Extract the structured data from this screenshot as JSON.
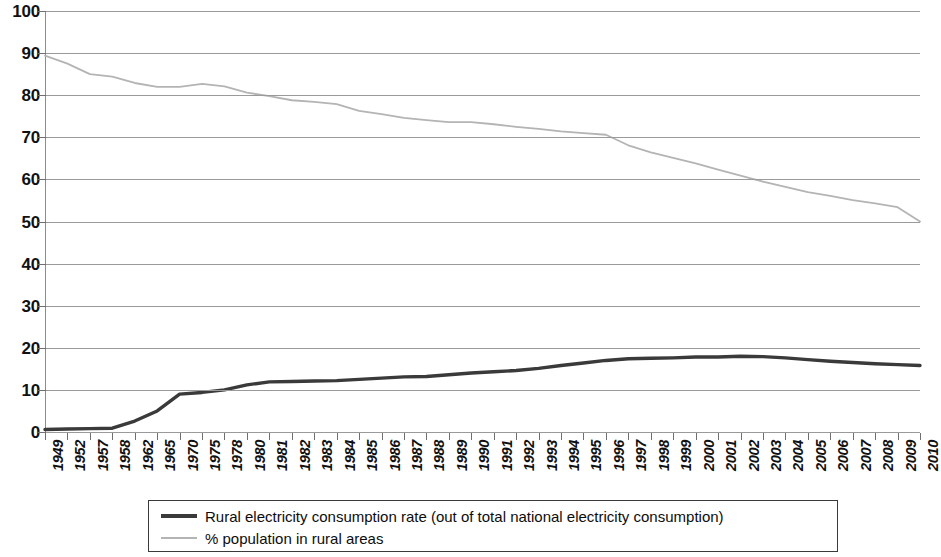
{
  "chart_data": {
    "type": "line",
    "title": "",
    "xlabel": "",
    "ylabel": "",
    "ylim": [
      0,
      100
    ],
    "y_ticks": [
      0,
      10,
      20,
      30,
      40,
      50,
      60,
      70,
      80,
      90,
      100
    ],
    "y_tick_labels": [
      "0",
      "10",
      "20",
      "30",
      "40",
      "50",
      "60",
      "70",
      "80",
      "90",
      "100"
    ],
    "grid": true,
    "legend_position": "bottom",
    "categories": [
      "1949",
      "1952",
      "1957",
      "1958",
      "1962",
      "1965",
      "1970",
      "1975",
      "1978",
      "1980",
      "1981",
      "1982",
      "1983",
      "1984",
      "1985",
      "1986",
      "1987",
      "1988",
      "1989",
      "1990",
      "1991",
      "1992",
      "1993",
      "1994",
      "1995",
      "1996",
      "1997",
      "1998",
      "1999",
      "2000",
      "2001",
      "2002",
      "2003",
      "2004",
      "2005",
      "2006",
      "2007",
      "2008",
      "2009",
      "2010"
    ],
    "series": [
      {
        "name": "Rural electricity consumption rate (out of total national electricity consumption)",
        "color": "#3a3a3a",
        "width": 3.4,
        "values": [
          0.6,
          0.7,
          0.8,
          0.9,
          2.6,
          5.0,
          9.0,
          9.4,
          10.0,
          11.2,
          11.9,
          12.0,
          12.1,
          12.2,
          12.5,
          12.8,
          13.1,
          13.2,
          13.6,
          14.0,
          14.3,
          14.6,
          15.1,
          15.8,
          16.4,
          17.0,
          17.4,
          17.5,
          17.6,
          17.8,
          17.8,
          18.0,
          17.9,
          17.6,
          17.2,
          16.8,
          16.5,
          16.2,
          16.0,
          15.8
        ]
      },
      {
        "name": "% population in rural areas",
        "color": "#b4b4b4",
        "width": 1.8,
        "values": [
          89.4,
          87.5,
          85.0,
          84.4,
          82.9,
          82.0,
          82.0,
          82.7,
          82.1,
          80.6,
          79.8,
          78.8,
          78.4,
          77.9,
          76.3,
          75.5,
          74.6,
          74.1,
          73.6,
          73.6,
          73.1,
          72.5,
          72.0,
          71.4,
          71.0,
          70.6,
          68.1,
          66.4,
          65.1,
          63.8,
          62.3,
          60.9,
          59.5,
          58.2,
          57.0,
          56.1,
          55.1,
          54.3,
          53.4,
          50.0
        ]
      }
    ],
    "legend": [
      {
        "label": "Rural electricity consumption rate (out of total national electricity consumption)",
        "style": "dark-thick"
      },
      {
        "label": "% population in rural areas",
        "style": "gray-thin"
      }
    ]
  }
}
